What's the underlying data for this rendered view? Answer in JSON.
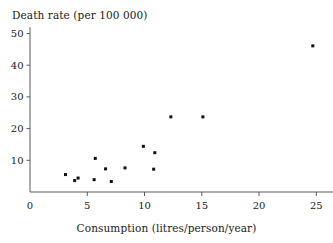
{
  "chart_data": {
    "type": "scatter",
    "title": "",
    "xlabel": "Consumption (litres/person/year)",
    "ylabel": "Death rate (per 100 000)",
    "xlim": [
      0,
      26.5
    ],
    "ylim": [
      0,
      52
    ],
    "grid": false,
    "legend": null,
    "xticks": [
      0,
      5,
      10,
      15,
      20,
      25
    ],
    "xticklabels": [
      "0",
      "5",
      "10",
      "15",
      "20",
      "25"
    ],
    "yticks": [
      10,
      20,
      30,
      40,
      50
    ],
    "yticklabels": [
      "10",
      "20",
      "30",
      "40",
      "50"
    ],
    "marker": "filled-square",
    "marker_color": "#111111",
    "points": [
      {
        "x": 3.1,
        "y": 5.5
      },
      {
        "x": 3.9,
        "y": 3.6
      },
      {
        "x": 4.2,
        "y": 4.4
      },
      {
        "x": 5.6,
        "y": 3.9
      },
      {
        "x": 5.7,
        "y": 10.6
      },
      {
        "x": 6.6,
        "y": 7.3
      },
      {
        "x": 7.1,
        "y": 3.3
      },
      {
        "x": 8.3,
        "y": 7.6
      },
      {
        "x": 9.9,
        "y": 14.4
      },
      {
        "x": 10.8,
        "y": 7.2
      },
      {
        "x": 10.9,
        "y": 12.4
      },
      {
        "x": 12.3,
        "y": 23.7
      },
      {
        "x": 15.1,
        "y": 23.7
      },
      {
        "x": 24.7,
        "y": 46.1
      }
    ]
  },
  "labels": {
    "y_axis_title": "Death rate (per 100 000)",
    "x_axis_title": "Consumption (litres/person/year)"
  }
}
